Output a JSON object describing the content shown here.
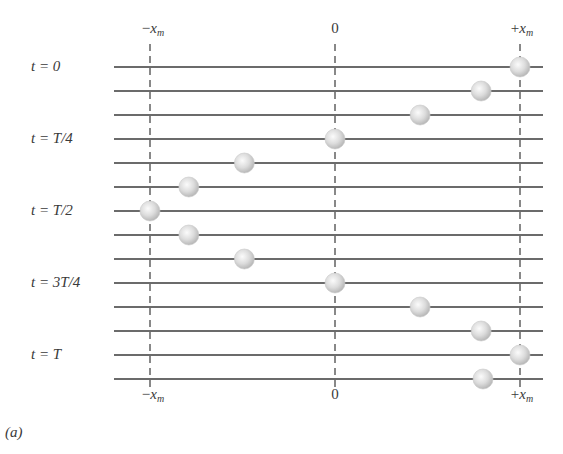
{
  "figure": {
    "panel_label": "(a)",
    "axis_labels": {
      "left": {
        "sign": "−",
        "var": "x",
        "sub": "m"
      },
      "center": {
        "text": "0"
      },
      "right": {
        "sign": "+",
        "var": "x",
        "sub": "m"
      }
    },
    "time_labels": [
      {
        "row": 0,
        "text": "t = 0"
      },
      {
        "row": 3,
        "text": "t = T/4"
      },
      {
        "row": 6,
        "text": "t = T/2"
      },
      {
        "row": 9,
        "text": "t = 3T/4"
      },
      {
        "row": 12,
        "text": "t = T"
      }
    ],
    "rows": [
      {
        "position": 1.0
      },
      {
        "position": 0.79
      },
      {
        "position": 0.46
      },
      {
        "position": 0.0
      },
      {
        "position": -0.49
      },
      {
        "position": -0.79
      },
      {
        "position": -1.0
      },
      {
        "position": -0.79
      },
      {
        "position": -0.49
      },
      {
        "position": 0.0
      },
      {
        "position": 0.46
      },
      {
        "position": 0.79
      },
      {
        "position": 1.0
      },
      {
        "position": 0.8
      }
    ],
    "colors": {
      "line": "#3a3a3a",
      "dash": "#3a3a3a",
      "ball_light": "#f4f4f4",
      "ball_dark": "#b8b8b8"
    }
  }
}
